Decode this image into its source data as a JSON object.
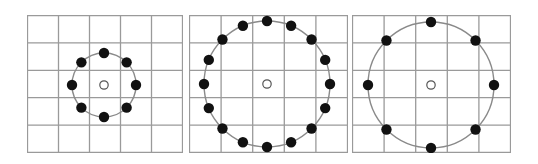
{
  "figure": {
    "colors": {
      "grid": "#9a9a9a",
      "panel_border": "#8c8c8c",
      "circle": "#8a8a8a",
      "sample_dot": "#111111",
      "center_point_stroke": "#555555",
      "center_point_fill": "#ffffff"
    },
    "panels": [
      {
        "id": "P1",
        "label": "8 samples, radius 1",
        "x": 27,
        "width": 156,
        "cols": 5,
        "rows": 5,
        "center": [
          77,
          70
        ],
        "radius": 32,
        "points": 8,
        "start_deg": -90
      },
      {
        "id": "P2",
        "label": "16 samples, radius 2",
        "x": 189,
        "width": 159,
        "cols": 5,
        "rows": 5,
        "center": [
          78,
          69
        ],
        "radius": 63,
        "points": 16,
        "start_deg": -90
      },
      {
        "id": "P3",
        "label": "8 samples, radius 2",
        "x": 352,
        "width": 159,
        "cols": 5,
        "rows": 5,
        "center": [
          79,
          70
        ],
        "radius": 63,
        "points": 8,
        "start_deg": -90
      }
    ]
  }
}
